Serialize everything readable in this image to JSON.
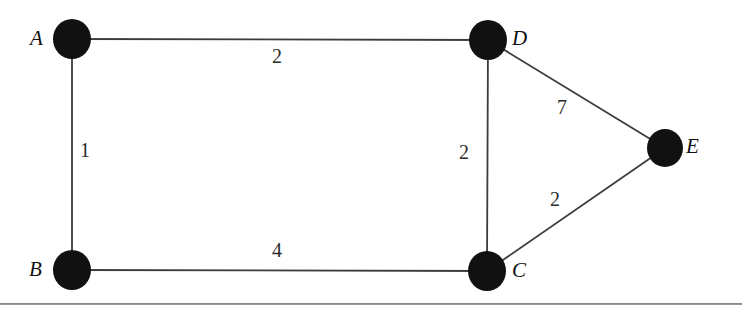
{
  "figure": {
    "kind": "weighted-undirected-graph",
    "background_color": "#ffffff",
    "ink_color": "#111111",
    "edge_color": "#3c3c3c",
    "rule_color": "#6e7277",
    "width": 742,
    "height": 314
  },
  "nodes": [
    {
      "id": "A",
      "label": "A",
      "cx": 72,
      "cy": 39,
      "rx": 19,
      "ry": 20,
      "label_x": 30,
      "label_y": 28
    },
    {
      "id": "D",
      "label": "D",
      "cx": 488,
      "cy": 40,
      "rx": 19,
      "ry": 20,
      "label_x": 512,
      "label_y": 28
    },
    {
      "id": "E",
      "label": "E",
      "cx": 665,
      "cy": 148,
      "rx": 18,
      "ry": 19,
      "label_x": 686,
      "label_y": 136
    },
    {
      "id": "B",
      "label": "B",
      "cx": 72,
      "cy": 270,
      "rx": 19,
      "ry": 20,
      "label_x": 29,
      "label_y": 259
    },
    {
      "id": "C",
      "label": "C",
      "cx": 487,
      "cy": 271,
      "rx": 19,
      "ry": 20,
      "label_x": 512,
      "label_y": 260
    }
  ],
  "edges": [
    {
      "id": "A-D",
      "from": "A",
      "to": "D",
      "weight": "2",
      "label_x": 272,
      "label_y": 46
    },
    {
      "id": "A-B",
      "from": "A",
      "to": "B",
      "weight": "1",
      "label_x": 80,
      "label_y": 140
    },
    {
      "id": "D-C",
      "from": "D",
      "to": "C",
      "weight": "2",
      "label_x": 459,
      "label_y": 142
    },
    {
      "id": "D-E",
      "from": "D",
      "to": "E",
      "weight": "7",
      "label_x": 557,
      "label_y": 97
    },
    {
      "id": "C-E",
      "from": "C",
      "to": "E",
      "weight": "2",
      "label_x": 550,
      "label_y": 189
    },
    {
      "id": "B-C",
      "from": "B",
      "to": "C",
      "weight": "4",
      "label_x": 272,
      "label_y": 240
    }
  ],
  "rule": {
    "y": 303
  }
}
